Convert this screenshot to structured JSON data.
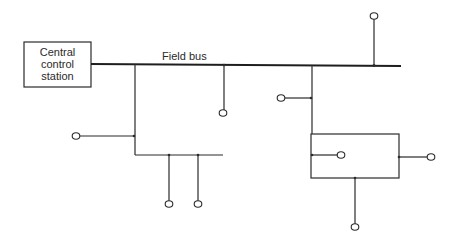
{
  "diagram": {
    "type": "network-topology",
    "central_station": {
      "label_lines": [
        "Central",
        "control",
        "station"
      ]
    },
    "bus": {
      "label": "Field bus"
    },
    "colors": {
      "line": "#2b2b2b",
      "bus": "#1e1e1e",
      "background": "#ffffff"
    },
    "nodes": [
      {
        "id": "top-right-device",
        "x": 374,
        "y": 16
      },
      {
        "id": "bus-drop-device",
        "x": 223,
        "y": 113
      },
      {
        "id": "right-branch-stub-device",
        "x": 281,
        "y": 98
      },
      {
        "id": "left-branch-stub-device",
        "x": 76,
        "y": 136
      },
      {
        "id": "sub-bus-device-1",
        "x": 169,
        "y": 204
      },
      {
        "id": "sub-bus-device-2",
        "x": 198,
        "y": 204
      },
      {
        "id": "subnet-inner-device",
        "x": 341,
        "y": 155
      },
      {
        "id": "subnet-right-device",
        "x": 431,
        "y": 157
      },
      {
        "id": "subnet-bottom-device",
        "x": 355,
        "y": 227
      }
    ]
  }
}
